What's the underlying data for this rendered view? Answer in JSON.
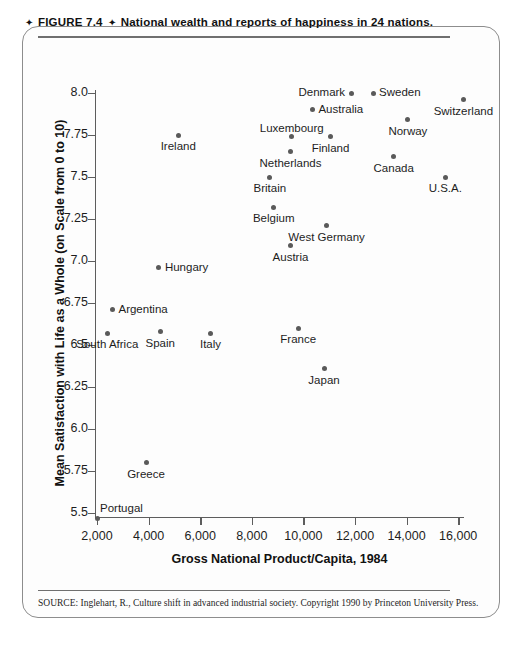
{
  "figure": {
    "caption_prefix": "FIGURE 7.4",
    "caption_diamond": "✦",
    "caption_title": "National wealth and reports of happiness in 24 nations.",
    "source_note": "SOURCE:  Inglehart, R., Culture shift in advanced industrial society. Copyright 1990 by Princeton University Press."
  },
  "chart_data": {
    "type": "scatter",
    "title": "National wealth and reports of happiness in 24 nations.",
    "xlabel": "Gross National Product/Capita, 1984",
    "ylabel": "Mean Satisfaction with Life as a Whole (on Scale from 0 to 10)",
    "xlim": [
      1500,
      17000
    ],
    "ylim": [
      5.4,
      8.1
    ],
    "xticks": [
      2000,
      4000,
      6000,
      8000,
      10000,
      12000,
      14000,
      16000
    ],
    "xtick_labels": [
      "2,000",
      "4,000",
      "6,000",
      "8,000",
      "10,000",
      "12,000",
      "14,000",
      "16,000"
    ],
    "yticks": [
      5.5,
      5.75,
      6.0,
      6.25,
      6.5,
      6.75,
      7.0,
      7.25,
      7.5,
      7.75,
      8.0
    ],
    "ytick_labels": [
      "5.5",
      "5.75",
      "6.0",
      "6.25",
      "6.5",
      "6.75",
      "7.0",
      "7.25",
      "7.5",
      "7.75",
      "8.0"
    ],
    "grid": false,
    "legend": "none",
    "marker_color": "#5a5a5a",
    "points": [
      {
        "name": "Switzerland",
        "x": 16200,
        "y": 7.96,
        "label_pos": "below"
      },
      {
        "name": "Denmark",
        "x": 11850,
        "y": 8.0,
        "label_pos": "left"
      },
      {
        "name": "Sweden",
        "x": 12700,
        "y": 8.0,
        "label_pos": "right"
      },
      {
        "name": "Australia",
        "x": 10350,
        "y": 7.9,
        "label_pos": "right"
      },
      {
        "name": "Norway",
        "x": 14050,
        "y": 7.84,
        "label_pos": "below"
      },
      {
        "name": "Luxembourg",
        "x": 9550,
        "y": 7.74,
        "label_pos": "above"
      },
      {
        "name": "Finland",
        "x": 11050,
        "y": 7.74,
        "label_pos": "below"
      },
      {
        "name": "Ireland",
        "x": 5150,
        "y": 7.75,
        "label_pos": "below"
      },
      {
        "name": "Canada",
        "x": 13500,
        "y": 7.62,
        "label_pos": "below"
      },
      {
        "name": "Netherlands",
        "x": 9500,
        "y": 7.65,
        "label_pos": "below"
      },
      {
        "name": "U.S.A.",
        "x": 15500,
        "y": 7.5,
        "label_pos": "below"
      },
      {
        "name": "Britain",
        "x": 8700,
        "y": 7.5,
        "label_pos": "below"
      },
      {
        "name": "West Germany",
        "x": 10900,
        "y": 7.21,
        "label_pos": "below"
      },
      {
        "name": "Belgium",
        "x": 8850,
        "y": 7.32,
        "label_pos": "below"
      },
      {
        "name": "Austria",
        "x": 9500,
        "y": 7.09,
        "label_pos": "below"
      },
      {
        "name": "Hungary",
        "x": 4400,
        "y": 6.96,
        "label_pos": "right"
      },
      {
        "name": "Argentina",
        "x": 2600,
        "y": 6.71,
        "label_pos": "right"
      },
      {
        "name": "South Africa",
        "x": 2400,
        "y": 6.57,
        "label_pos": "below"
      },
      {
        "name": "Spain",
        "x": 4450,
        "y": 6.58,
        "label_pos": "below"
      },
      {
        "name": "Italy",
        "x": 6400,
        "y": 6.57,
        "label_pos": "below"
      },
      {
        "name": "France",
        "x": 9800,
        "y": 6.6,
        "label_pos": "below"
      },
      {
        "name": "Japan",
        "x": 10800,
        "y": 6.36,
        "label_pos": "below"
      },
      {
        "name": "Greece",
        "x": 3900,
        "y": 5.8,
        "label_pos": "below"
      },
      {
        "name": "Portugal",
        "x": 2000,
        "y": 5.47,
        "label_pos": "right-above"
      }
    ]
  }
}
